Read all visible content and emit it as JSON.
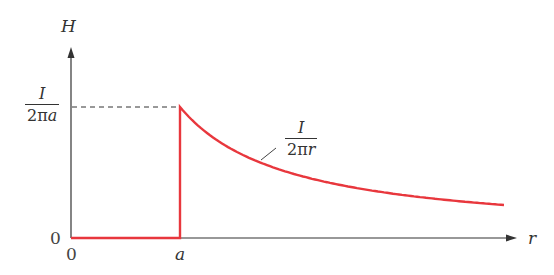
{
  "diagram": {
    "y_axis_label": "H",
    "x_axis_label": "r",
    "y_origin_label": "0",
    "x_origin_label": "0",
    "x_tick_a": "a",
    "y_tick_fraction": {
      "numerator": "I",
      "denominator_prefix": "2π",
      "denominator_var": "a"
    },
    "curve_label": {
      "numerator": "I",
      "denominator_prefix": "2π",
      "denominator_var": "r"
    },
    "curve_color": "#e8373d",
    "axis_color": "#333333"
  },
  "chart_data": {
    "type": "line",
    "title": "",
    "xlabel": "r",
    "ylabel": "H",
    "x": [
      0,
      1,
      1,
      1.5,
      2,
      2.5,
      3,
      3.5,
      4
    ],
    "x_units": "multiples of a",
    "values": [
      0,
      0,
      1,
      0.667,
      0.5,
      0.4,
      0.333,
      0.286,
      0.25
    ],
    "y_units": "multiples of I/(2πa)",
    "series": [
      {
        "name": "H(r)",
        "color": "#e8373d"
      }
    ],
    "grid": false
  }
}
